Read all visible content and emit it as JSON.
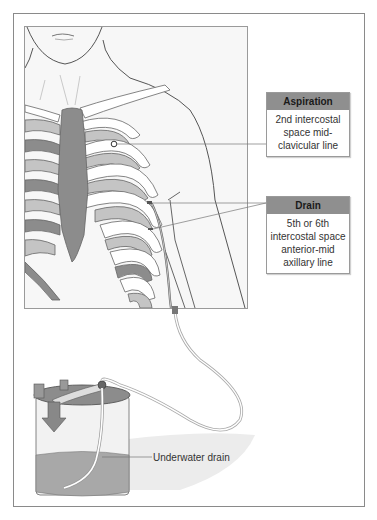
{
  "diagram": {
    "type": "anatomical-illustration",
    "labels": {
      "aspiration": {
        "title": "Aspiration",
        "body": "2nd intercostal space mid-clavicular line"
      },
      "drain": {
        "title": "Drain",
        "body": "5th or 6th intercostal space anterior-mid axillary line"
      },
      "jar": {
        "text": "Underwater drain"
      }
    },
    "colors": {
      "label_header": "#8f8f8f",
      "bone": "#8c8c8c",
      "rib_light": "#c4c4c4",
      "skin": "#f7f7f7",
      "outline": "#555555",
      "water": "#a8a8a8"
    }
  }
}
